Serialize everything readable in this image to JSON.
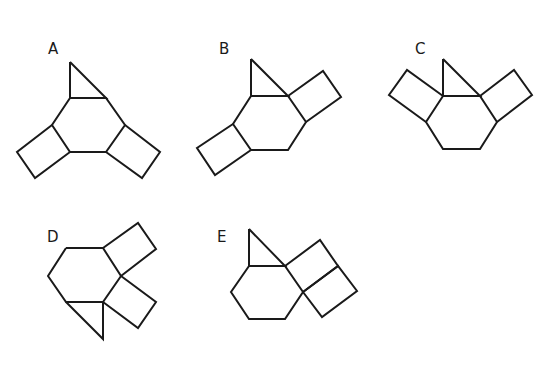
{
  "figure": {
    "type": "molecular-skeleton-options",
    "stroke_color": "#1a1a1a",
    "background": "#ffffff",
    "options": [
      {
        "label": "A",
        "label_pos": [
          48,
          54
        ],
        "polylines": [
          [
            [
              70,
              62
            ],
            [
              70,
              98
            ],
            [
              106,
              98
            ],
            [
              70,
              62
            ]
          ],
          [
            [
              70,
              98
            ],
            [
              106,
              98
            ],
            [
              125,
              125
            ],
            [
              106,
              152
            ],
            [
              70,
              152
            ],
            [
              52,
              125
            ],
            [
              70,
              98
            ]
          ],
          [
            [
              52,
              125
            ],
            [
              17,
              152
            ],
            [
              35,
              178
            ],
            [
              70,
              152
            ]
          ],
          [
            [
              125,
              125
            ],
            [
              160,
              152
            ],
            [
              142,
              178
            ],
            [
              106,
              152
            ]
          ]
        ]
      },
      {
        "label": "B",
        "label_pos": [
          219,
          54
        ],
        "polylines": [
          [
            [
              251,
              59
            ],
            [
              251,
              96
            ],
            [
              288,
              96
            ],
            [
              251,
              59
            ]
          ],
          [
            [
              251,
              96
            ],
            [
              288,
              96
            ],
            [
              306,
              122
            ],
            [
              288,
              150
            ],
            [
              251,
              150
            ],
            [
              233,
              124
            ],
            [
              251,
              96
            ]
          ],
          [
            [
              288,
              96
            ],
            [
              323,
              71
            ],
            [
              341,
              97
            ],
            [
              306,
              122
            ]
          ],
          [
            [
              233,
              124
            ],
            [
              197,
              148
            ],
            [
              215,
              175
            ],
            [
              251,
              150
            ]
          ]
        ]
      },
      {
        "label": "C",
        "label_pos": [
          415,
          54
        ],
        "polylines": [
          [
            [
              443,
              59
            ],
            [
              443,
              96
            ],
            [
              480,
              96
            ],
            [
              443,
              59
            ]
          ],
          [
            [
              443,
              96
            ],
            [
              480,
              96
            ],
            [
              497,
              122
            ],
            [
              480,
              149
            ],
            [
              443,
              149
            ],
            [
              426,
              122
            ],
            [
              443,
              96
            ]
          ],
          [
            [
              443,
              96
            ],
            [
              407,
              70
            ],
            [
              389,
              95
            ],
            [
              426,
              122
            ]
          ],
          [
            [
              480,
              96
            ],
            [
              514,
              70
            ],
            [
              532,
              95
            ],
            [
              497,
              122
            ]
          ]
        ]
      },
      {
        "label": "D",
        "label_pos": [
          47,
          242
        ],
        "polylines": [
          [
            [
              66,
              248
            ],
            [
              103,
              248
            ],
            [
              121,
              276
            ],
            [
              103,
              302
            ],
            [
              66,
              302
            ],
            [
              48,
              276
            ],
            [
              66,
              248
            ]
          ],
          [
            [
              66,
              302
            ],
            [
              103,
              302
            ],
            [
              103,
              339
            ],
            [
              66,
              302
            ]
          ],
          [
            [
              103,
              248
            ],
            [
              138,
              223
            ],
            [
              156,
              249
            ],
            [
              121,
              276
            ]
          ],
          [
            [
              121,
              276
            ],
            [
              156,
              302
            ],
            [
              138,
              328
            ],
            [
              103,
              302
            ]
          ]
        ]
      },
      {
        "label": "E",
        "label_pos": [
          217,
          242
        ],
        "polylines": [
          [
            [
              249,
              229
            ],
            [
              249,
              266
            ],
            [
              285,
              266
            ],
            [
              249,
              229
            ]
          ],
          [
            [
              249,
              266
            ],
            [
              285,
              266
            ],
            [
              303,
              292
            ],
            [
              285,
              319
            ],
            [
              249,
              319
            ],
            [
              231,
              292
            ],
            [
              249,
              266
            ]
          ],
          [
            [
              285,
              266
            ],
            [
              320,
              240
            ],
            [
              338,
              266
            ],
            [
              303,
              292
            ]
          ],
          [
            [
              303,
              292
            ],
            [
              338,
              266
            ],
            [
              357,
              291
            ],
            [
              322,
              317
            ],
            [
              303,
              292
            ]
          ]
        ]
      }
    ]
  }
}
